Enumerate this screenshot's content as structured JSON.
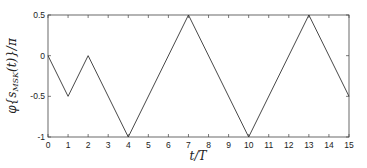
{
  "chart_data": {
    "type": "line",
    "title": "",
    "xlabel": "t/T",
    "ylabel": "φ{s_MSK(t)}/π",
    "xlim": [
      0,
      15
    ],
    "ylim": [
      -1,
      0.5
    ],
    "xticks": [
      0,
      1,
      2,
      3,
      4,
      5,
      6,
      7,
      8,
      9,
      10,
      11,
      12,
      13,
      14,
      15
    ],
    "yticks": [
      -1,
      -0.5,
      0,
      0.5
    ],
    "ytick_labels": [
      "-1",
      "-0.5",
      "0",
      "0.5"
    ],
    "grid": false,
    "legend": null,
    "series": [
      {
        "name": "phase",
        "x": [
          0,
          1,
          2,
          4,
          7,
          10,
          13,
          15
        ],
        "y": [
          0,
          -0.5,
          0,
          -1,
          0.5,
          -1,
          0.5,
          -0.5
        ],
        "color": "#333333"
      }
    ]
  },
  "labels": {
    "xlabel": "t/T",
    "ylabel_main": "φ{s",
    "ylabel_sub": "MSK",
    "ylabel_tail": "(t)}/π"
  }
}
